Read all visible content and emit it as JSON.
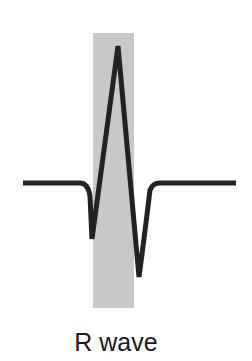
{
  "figure": {
    "label": "R wave",
    "highlight_color": "#c8c8c8",
    "trace_color": "#222222"
  },
  "waveform": {
    "segments": [
      "baseline",
      "Q dip",
      "R peak",
      "S dip",
      "baseline"
    ],
    "highlighted_segment": "R wave"
  }
}
